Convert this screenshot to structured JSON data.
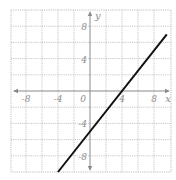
{
  "chart_data": {
    "type": "line",
    "title": "",
    "xlabel": "x",
    "ylabel": "y",
    "xlim": [
      -10,
      10
    ],
    "ylim": [
      -10,
      10
    ],
    "grid": true,
    "grid_step": 2,
    "x_ticks": [
      -8,
      -4,
      0,
      4,
      8
    ],
    "y_ticks": [
      8,
      4,
      -4,
      -8
    ],
    "tick_labels": {
      "x": [
        "-8",
        "-4",
        "0",
        "4",
        "8"
      ],
      "y": [
        "8",
        "4",
        "-4",
        "-8"
      ]
    },
    "series": [
      {
        "name": "line",
        "equation": "y = 1.25x - 5",
        "slope": 1.25,
        "intercept": -5,
        "x": [
          -4,
          9.6
        ],
        "y": [
          -10,
          7
        ],
        "color": "#111111"
      }
    ],
    "legend": null
  },
  "labels": {
    "x_axis": "x",
    "y_axis": "y"
  },
  "colors": {
    "grid": "#b9b9b9",
    "axis": "#8a8a8a",
    "line": "#111111",
    "background": "#ffffff"
  }
}
